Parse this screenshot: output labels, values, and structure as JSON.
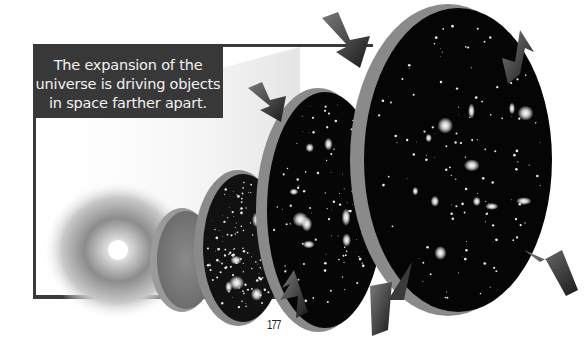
{
  "caption": {
    "lines": [
      "The expansion of the",
      "universe is driving objects",
      "in space farther apart."
    ]
  },
  "page": {
    "number": "177"
  },
  "illustration": {
    "subject": "universe expansion slices from big bang to present",
    "stages": [
      "big-bang-flash",
      "early-plasma",
      "dense-star-field",
      "galaxy-field-small",
      "galaxy-field-large"
    ],
    "colors": {
      "frame": "#3a3a3a",
      "caption_bg": "#383838",
      "caption_text": "#f2f2f2",
      "space": "#050505",
      "rim": "#8a8a8a"
    }
  }
}
